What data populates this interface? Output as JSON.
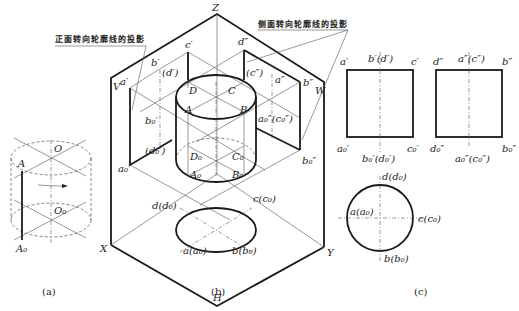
{
  "figure": {
    "panels": [
      {
        "id": "a",
        "caption": "(a)"
      },
      {
        "id": "b",
        "caption": "(b)"
      },
      {
        "id": "c",
        "caption": "(c)"
      }
    ],
    "annotations": {
      "front_contour": "正面转向轮廓线的投影",
      "side_contour": "侧面转向轮廓线的投影"
    },
    "panel_a": {
      "labels": {
        "O": "O",
        "O0": "O₀",
        "A": "A",
        "A0": "A₀"
      }
    },
    "panel_b": {
      "axes": {
        "Z": "Z",
        "X": "X",
        "Y": "Y",
        "H": "H",
        "V": "V",
        "W": "W"
      },
      "cylinder": {
        "D": "D",
        "C": "C",
        "A": "A",
        "B": "B",
        "D0": "D₀",
        "C0": "C₀",
        "A0": "A₀",
        "B0": "B₀"
      },
      "front_proj": {
        "a1": "a′",
        "b1": "b′",
        "c1": "c′",
        "d1": "(d′)",
        "b01": "b₀′",
        "d01": "(d₀′)",
        "a01": "a₀′"
      },
      "side_proj": {
        "d2": "d″",
        "c2": "(c″)",
        "a2": "a″",
        "b2": "b″",
        "a02c02": "a₀″(c₀″)",
        "b02": "b₀″"
      },
      "top_proj": {
        "d": "d(d₀)",
        "c": "c(c₀)",
        "a": "a(a₀)",
        "b": "b(b₀)"
      }
    },
    "panel_c": {
      "front_view": {
        "tl": "a′",
        "tm": "b′(d′)",
        "tr": "c′",
        "bl": "a₀′",
        "bm": "b₀′(d₀′)",
        "br": "c₀′"
      },
      "side_view": {
        "tl": "d″",
        "tm": "a″(c″)",
        "tr": "b″",
        "bl": "d₀″",
        "bm": "a₀″(c₀″)",
        "br": "b₀″"
      },
      "top_view": {
        "top": "d(d₀)",
        "left": "a(a₀)",
        "right": "c(c₀)",
        "bottom": "b(b₀)"
      }
    }
  }
}
